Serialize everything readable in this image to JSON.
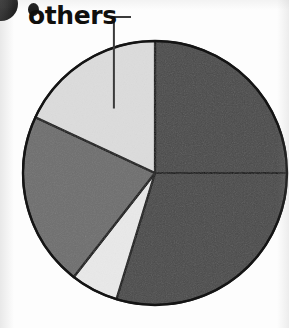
{
  "figure": {
    "name": "pie-chart-figure",
    "background_color": "#fdfdfd"
  },
  "annotation": {
    "label": "others",
    "leader_line": "elbow-leader-line",
    "leader_color": "#3a3a3a",
    "text_color": "#100f0d"
  },
  "marker": {
    "name": "corner-bullet",
    "color": "#1d1d1d"
  },
  "chart_data": {
    "type": "pie",
    "title": "",
    "xlabel": "",
    "ylabel": "",
    "legend": "none",
    "grid": false,
    "start_angle_deg": 0,
    "direction": "clockwise",
    "center": {
      "x": 155,
      "y": 173
    },
    "radius": 132,
    "outline_color": "#141414",
    "labels": [
      "segment-1",
      "segment-2",
      "others-small",
      "segment-3",
      "others"
    ],
    "values": [
      25.0,
      29.7,
      5.8,
      21.4,
      18.1
    ],
    "colors": [
      "#4a4a4a",
      "#4a4a4a",
      "#e9e9e9",
      "#6e6e6e",
      "#dcdcdc"
    ],
    "slices": [
      {
        "label": "segment-1",
        "value": 25.0,
        "start_deg": 0.0,
        "end_deg": 90.0,
        "color": "#4a4a4a",
        "shade": "dark-gray"
      },
      {
        "label": "segment-2",
        "value": 29.7,
        "start_deg": 90.0,
        "end_deg": 197.0,
        "color": "#4a4a4a",
        "shade": "dark-gray"
      },
      {
        "label": "others-small",
        "value": 5.8,
        "start_deg": 197.0,
        "end_deg": 218.0,
        "color": "#e9e9e9",
        "shade": "very-light-gray"
      },
      {
        "label": "segment-3",
        "value": 21.4,
        "start_deg": 218.0,
        "end_deg": 295.0,
        "color": "#6e6e6e",
        "shade": "medium-gray"
      },
      {
        "label": "others",
        "value": 18.1,
        "start_deg": 295.0,
        "end_deg": 360.0,
        "color": "#dcdcdc",
        "shade": "light-gray"
      }
    ]
  }
}
